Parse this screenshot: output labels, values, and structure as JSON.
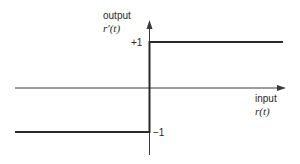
{
  "diagram": {
    "type": "signum-transfer-function",
    "y_axis": {
      "label": "output",
      "symbol": "r′(t)"
    },
    "x_axis": {
      "label": "input",
      "symbol": "r(t)"
    },
    "levels": {
      "high": "+1",
      "low": "−1"
    },
    "colors": {
      "line": "#2a2a2a",
      "axis": "#3a3a3a",
      "background": "#ffffff"
    }
  }
}
